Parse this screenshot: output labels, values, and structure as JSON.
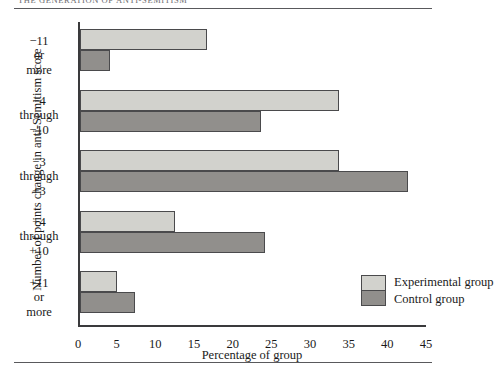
{
  "running_head": "THE GENERATION OF ANTI-SEMITISM",
  "chart_data": {
    "type": "bar",
    "orientation": "horizontal",
    "title": "",
    "xlabel": "Percentage of group",
    "ylabel": "Number of points change in anti-Semitism score",
    "xlim": [
      0,
      45
    ],
    "xticks": [
      0,
      5,
      10,
      15,
      20,
      25,
      30,
      35,
      40,
      45
    ],
    "grid": false,
    "legend_position": "inside-bottom-right",
    "categories": [
      "−11\nor\nmore",
      "−4\nthrough\n−10",
      "−3\nthrough\n+3",
      "+4\nthrough\n+10",
      "+11\nor\nmore"
    ],
    "category_lines": [
      [
        "−11",
        "or",
        "more"
      ],
      [
        "−4",
        "through",
        "−10"
      ],
      [
        "−3",
        "through",
        "+3"
      ],
      [
        "+4",
        "through",
        "+10"
      ],
      [
        "+11",
        "or",
        "more"
      ]
    ],
    "series": [
      {
        "name": "Experimental group",
        "color": "#d2d2cd",
        "values": [
          16.5,
          33.5,
          33.5,
          12.4,
          4.8
        ]
      },
      {
        "name": "Control group",
        "color": "#918f8c",
        "values": [
          3.9,
          23.5,
          42.5,
          24.0,
          7.2
        ]
      }
    ]
  },
  "legend": {
    "experimental_label": "Experimental group",
    "control_label": "Control group"
  }
}
